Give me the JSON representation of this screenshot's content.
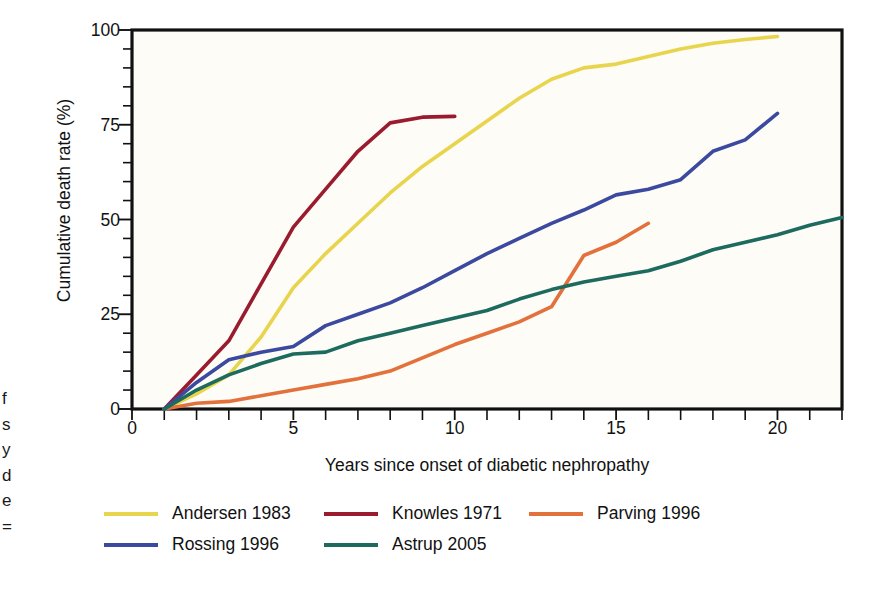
{
  "chart_data": {
    "type": "line",
    "title": "",
    "xlabel": "Years since onset of diabetic nephropathy",
    "ylabel": "Cumulative death rate (%)",
    "xlim": [
      0,
      22
    ],
    "ylim": [
      0,
      100
    ],
    "x_ticks_major": [
      0,
      5,
      10,
      15,
      20
    ],
    "x_tick_labels": [
      "0",
      "5",
      "10",
      "15",
      "20"
    ],
    "x_tick_step_minor": 1,
    "y_ticks_major": [
      0,
      25,
      50,
      75,
      100
    ],
    "y_tick_labels": [
      "0",
      "25",
      "50",
      "75",
      "100"
    ],
    "y_tick_step_minor": 5,
    "grid": false,
    "legend_position": "below-left",
    "plot_background": "#fdfcf7",
    "axis_color": "#111111",
    "series": [
      {
        "name": "Andersen 1983",
        "color": "#e8d44d",
        "points": [
          [
            1,
            0
          ],
          [
            2,
            4
          ],
          [
            3,
            9
          ],
          [
            4,
            19
          ],
          [
            5,
            32
          ],
          [
            6,
            41
          ],
          [
            7,
            49
          ],
          [
            8,
            57
          ],
          [
            9,
            64
          ],
          [
            10,
            70
          ],
          [
            11,
            76
          ],
          [
            12,
            82
          ],
          [
            13,
            87
          ],
          [
            14,
            90
          ],
          [
            15,
            91
          ],
          [
            16,
            93
          ],
          [
            17,
            95
          ],
          [
            18,
            96.5
          ],
          [
            19,
            97.5
          ],
          [
            20,
            98.3
          ]
        ]
      },
      {
        "name": "Knowles 1971",
        "color": "#9b1b2e",
        "points": [
          [
            1,
            0
          ],
          [
            2,
            9
          ],
          [
            3,
            18
          ],
          [
            4,
            33
          ],
          [
            5,
            48
          ],
          [
            6,
            58
          ],
          [
            7,
            68
          ],
          [
            8,
            75.5
          ],
          [
            9,
            77
          ],
          [
            10,
            77.2
          ]
        ]
      },
      {
        "name": "Parving 1996",
        "color": "#e2713c",
        "points": [
          [
            1,
            0
          ],
          [
            2,
            1.5
          ],
          [
            3,
            2
          ],
          [
            4,
            3.5
          ],
          [
            5,
            5
          ],
          [
            6,
            6.5
          ],
          [
            7,
            8
          ],
          [
            8,
            10
          ],
          [
            9,
            13.5
          ],
          [
            10,
            17
          ],
          [
            11,
            20
          ],
          [
            12,
            23
          ],
          [
            13,
            27
          ],
          [
            14,
            40.5
          ],
          [
            15,
            44
          ],
          [
            16,
            49
          ]
        ]
      },
      {
        "name": "Rossing 1996",
        "color": "#3b4a9e",
        "points": [
          [
            1,
            0
          ],
          [
            2,
            7
          ],
          [
            3,
            13
          ],
          [
            4,
            15
          ],
          [
            5,
            16.5
          ],
          [
            6,
            22
          ],
          [
            7,
            25
          ],
          [
            8,
            28
          ],
          [
            9,
            32
          ],
          [
            10,
            36.5
          ],
          [
            11,
            41
          ],
          [
            12,
            45
          ],
          [
            13,
            49
          ],
          [
            14,
            52.5
          ],
          [
            15,
            56.5
          ],
          [
            16,
            58
          ],
          [
            17,
            60.5
          ],
          [
            18,
            68
          ],
          [
            19,
            71
          ],
          [
            20,
            78
          ]
        ]
      },
      {
        "name": "Astrup 2005",
        "color": "#1d6a5e",
        "points": [
          [
            1,
            0
          ],
          [
            2,
            5
          ],
          [
            3,
            9
          ],
          [
            4,
            12
          ],
          [
            5,
            14.5
          ],
          [
            6,
            15
          ],
          [
            7,
            18
          ],
          [
            8,
            20
          ],
          [
            9,
            22
          ],
          [
            10,
            24
          ],
          [
            11,
            26
          ],
          [
            12,
            29
          ],
          [
            13,
            31.5
          ],
          [
            14,
            33.5
          ],
          [
            15,
            35
          ],
          [
            16,
            36.5
          ],
          [
            17,
            39
          ],
          [
            18,
            42
          ],
          [
            19,
            44
          ],
          [
            20,
            46
          ],
          [
            21,
            48.5
          ],
          [
            22,
            50.5
          ]
        ]
      }
    ]
  },
  "legend": {
    "rows": [
      [
        {
          "label": "Andersen 1983",
          "color": "#e8d44d"
        },
        {
          "label": "Knowles 1971",
          "color": "#9b1b2e"
        },
        {
          "label": "Parving 1996",
          "color": "#e2713c"
        }
      ],
      [
        {
          "label": "Rossing 1996",
          "color": "#3b4a9e"
        },
        {
          "label": "Astrup 2005",
          "color": "#1d6a5e"
        }
      ]
    ]
  },
  "caption_edge": {
    "fragments": [
      "f",
      "s",
      "y",
      "d",
      "e",
      "="
    ]
  }
}
